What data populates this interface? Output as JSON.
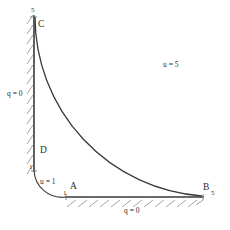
{
  "figure": {
    "title": "",
    "stroke_color": "#3a3a3a",
    "text_color": "#2b2b2b",
    "background": "#ffffff"
  },
  "points": [
    {
      "id": "A",
      "label": "A",
      "tick": "1"
    },
    {
      "id": "B",
      "label": "B",
      "tick": "5"
    },
    {
      "id": "C",
      "label": "C",
      "tick": "5"
    },
    {
      "id": "D",
      "label": "D",
      "tick": "1"
    }
  ],
  "point_labels": {
    "A": "A",
    "B": "B",
    "C": "C",
    "D": "D"
  },
  "axis_ticks": {
    "top": "5",
    "right": "5",
    "inner_vertical": "1",
    "inner_horizontal": "1"
  },
  "boundary_conditions": {
    "left_edge": "q = 0",
    "bottom_edge": "q = 0",
    "inner_arc": "u = 1",
    "outer_arc": "u = 5"
  },
  "geometry": {
    "center_x": 34,
    "center_y": 197,
    "inner_radius": 33,
    "outer_radius": 180,
    "top_y": 17,
    "right_x": 202
  }
}
